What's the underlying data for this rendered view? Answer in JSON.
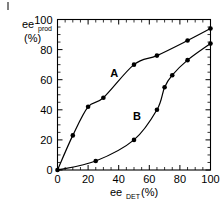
{
  "chart_data": {
    "type": "scatter",
    "title": "",
    "xlabel": "ee_DET (%)",
    "xlabel_main": "ee",
    "xlabel_sub": "DET",
    "xlabel_unit": "(%)",
    "ylabel": "ee_prod (%)",
    "ylabel_main": "ee",
    "ylabel_sub": "prod",
    "ylabel_unit": "(%)",
    "xlim": [
      0,
      100
    ],
    "ylim": [
      0,
      100
    ],
    "x_major_ticks": [
      0,
      20,
      40,
      60,
      80,
      100
    ],
    "y_major_ticks": [
      0,
      20,
      40,
      60,
      80,
      100
    ],
    "x_tick_labels": [
      "0",
      "20",
      "40",
      "60",
      "80",
      "100"
    ],
    "y_tick_labels": [
      "0",
      "20",
      "40",
      "60",
      "80",
      "100"
    ],
    "x_minor_interval": 5,
    "y_minor_interval": 5,
    "grid": false,
    "legend": "inline-annotations",
    "marker_color": "#000000",
    "line_color": "#000000",
    "series": [
      {
        "name": "A",
        "annotation": "A",
        "annotation_x": 37,
        "annotation_y": 62,
        "points": [
          {
            "x": 0,
            "y": 0
          },
          {
            "x": 10,
            "y": 23
          },
          {
            "x": 20,
            "y": 42
          },
          {
            "x": 30,
            "y": 48
          },
          {
            "x": 50,
            "y": 70
          },
          {
            "x": 65,
            "y": 76
          },
          {
            "x": 85,
            "y": 86
          },
          {
            "x": 100,
            "y": 94
          }
        ]
      },
      {
        "name": "B",
        "annotation": "B",
        "annotation_x": 52,
        "annotation_y": 33,
        "points": [
          {
            "x": 0,
            "y": 0
          },
          {
            "x": 25,
            "y": 6
          },
          {
            "x": 50,
            "y": 20
          },
          {
            "x": 65,
            "y": 40
          },
          {
            "x": 70,
            "y": 55
          },
          {
            "x": 75,
            "y": 63
          },
          {
            "x": 85,
            "y": 73
          },
          {
            "x": 100,
            "y": 84
          }
        ]
      }
    ]
  }
}
